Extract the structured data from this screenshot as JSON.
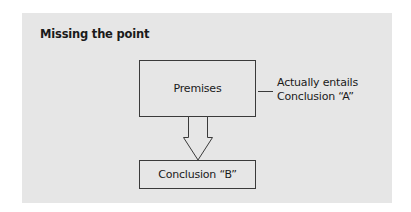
{
  "diagram": {
    "title": "Missing the point",
    "nodes": {
      "premises": {
        "label": "Premises"
      },
      "conclusion_b": {
        "label": "Conclusion “B”"
      }
    },
    "annotation": {
      "line1": "Actually entails",
      "line2": "Conclusion “A”"
    },
    "edges": [
      {
        "from": "premises",
        "to": "conclusion_b",
        "type": "hollow-arrow"
      },
      {
        "from": "premises",
        "to": "annotation",
        "type": "line"
      }
    ],
    "colors": {
      "panel_background": "#e6e6e6",
      "stroke": "#3a3a3a",
      "text": "#1a1a1a"
    }
  }
}
